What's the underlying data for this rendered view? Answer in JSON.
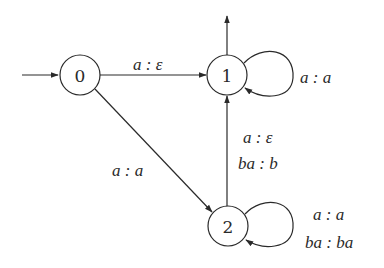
{
  "diagram": {
    "type": "finite-state transducer",
    "states": [
      {
        "id": "0",
        "label": "0",
        "initial": true,
        "final": false
      },
      {
        "id": "1",
        "label": "1",
        "initial": false,
        "final": true
      },
      {
        "id": "2",
        "label": "2",
        "initial": false,
        "final": false
      }
    ],
    "transitions": [
      {
        "from": "0",
        "to": "1",
        "labels": [
          "a : ε"
        ]
      },
      {
        "from": "1",
        "to": "1",
        "labels": [
          "a : a"
        ]
      },
      {
        "from": "0",
        "to": "2",
        "labels": [
          "a : a"
        ]
      },
      {
        "from": "2",
        "to": "1",
        "labels": [
          "a : ε",
          "ba : b"
        ]
      },
      {
        "from": "2",
        "to": "2",
        "labels": [
          "a : a",
          "ba : ba"
        ]
      }
    ]
  }
}
